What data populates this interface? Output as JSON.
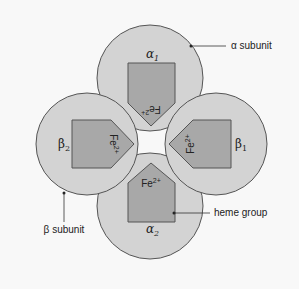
{
  "diagram": {
    "colors": {
      "background": "#f8f8f8",
      "subunit_fill": "#d3d3d3",
      "heme_fill": "#a8a8a8",
      "stroke": "#555555"
    },
    "subunits": [
      {
        "id": "alpha1",
        "symbol": "α",
        "index": "1",
        "position": "top",
        "heme_label": "Fe",
        "heme_charge": "2+"
      },
      {
        "id": "beta1",
        "symbol": "β",
        "index": "1",
        "position": "right",
        "heme_label": "Fe",
        "heme_charge": "2+"
      },
      {
        "id": "alpha2",
        "symbol": "α",
        "index": "2",
        "position": "bottom",
        "heme_label": "Fe",
        "heme_charge": "2+"
      },
      {
        "id": "beta2",
        "symbol": "β",
        "index": "2",
        "position": "left",
        "heme_label": "Fe",
        "heme_charge": "2+"
      }
    ],
    "callouts": {
      "alpha_subunit": "α subunit",
      "beta_subunit": "β subunit",
      "heme_group": "heme group"
    }
  }
}
